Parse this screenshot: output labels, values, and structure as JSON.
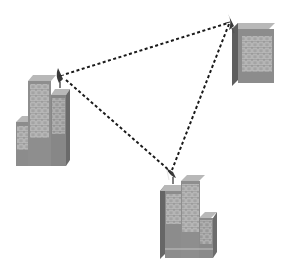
{
  "diagram": {
    "colors": {
      "background": "#ffffff",
      "building_front": "#8a8a8a",
      "building_side": "#6b6b6b",
      "building_top": "#b5b5b5",
      "window": "#a8a8a8",
      "window_outline": "#d6d6d6",
      "link": "#1a1a1a",
      "dish": "#3a3a3a"
    },
    "nodes": [
      {
        "id": "building-left",
        "label": "",
        "dish": {
          "x": 62,
          "y": 76
        }
      },
      {
        "id": "building-top-right",
        "label": "",
        "dish": {
          "x": 229,
          "y": 22
        }
      },
      {
        "id": "building-bottom",
        "label": "",
        "dish": {
          "x": 170,
          "y": 172
        }
      }
    ],
    "links": [
      {
        "from": "building-left",
        "to": "building-top-right",
        "style": "dashed"
      },
      {
        "from": "building-left",
        "to": "building-bottom",
        "style": "dashed"
      },
      {
        "from": "building-top-right",
        "to": "building-bottom",
        "style": "dashed"
      }
    ]
  }
}
